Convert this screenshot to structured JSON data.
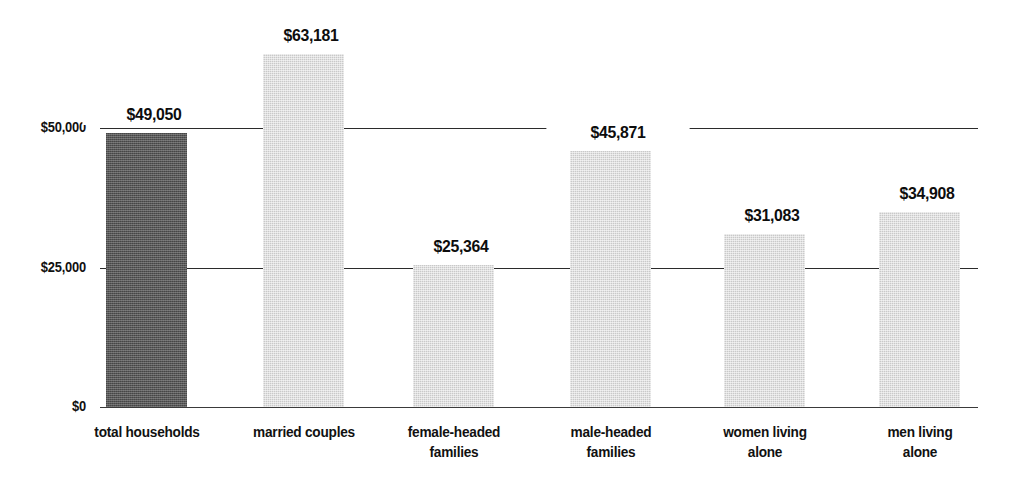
{
  "chart_data": {
    "type": "bar",
    "title": "",
    "subtitle": "",
    "xlabel": "",
    "ylabel": "",
    "ylim": [
      0,
      70000
    ],
    "grid": true,
    "legend": null,
    "axis": {
      "y_ticks": [
        {
          "value": 0,
          "label": "$0"
        },
        {
          "value": 25000,
          "label": "$25,000"
        },
        {
          "value": 50000,
          "label": "$50,000"
        }
      ]
    },
    "categories": [
      "total households",
      "married couples",
      "female-headed families",
      "male-headed families",
      "women living alone",
      "men living alone"
    ],
    "category_lines": [
      [
        "total households"
      ],
      [
        "married couples"
      ],
      [
        "female-headed",
        "families"
      ],
      [
        "male-headed",
        "families"
      ],
      [
        "women living",
        "alone"
      ],
      [
        "men living",
        "alone"
      ]
    ],
    "values": [
      49050,
      63181,
      25364,
      45871,
      31083,
      34908
    ],
    "value_labels": [
      "$49,050",
      "$63,181",
      "$25,364",
      "$45,871",
      "$31,083",
      "$34,908"
    ],
    "bar_styles": [
      "dark",
      "light",
      "light",
      "light",
      "light",
      "light"
    ],
    "colors": {
      "bar_dark": "#575757",
      "bar_light": "#c9c9c9",
      "gridline": "#2b2b2b",
      "text": "#111111",
      "background": "#ffffff"
    }
  }
}
